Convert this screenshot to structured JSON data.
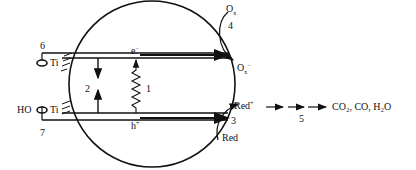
{
  "diagram": {
    "labels": {
      "n1": "1",
      "n2": "2",
      "n3": "3",
      "n4": "4",
      "n5": "5",
      "n6": "6",
      "n7": "7",
      "electron": "e",
      "electron_sup": "−",
      "hole": "h",
      "hole_sup": "+",
      "ti_top": "Ti",
      "ti_bottom": "Ti",
      "ho": "HO",
      "ox": "O",
      "ox_sub": "x",
      "ox_minus": "O",
      "ox_minus_sub": "x",
      "ox_minus_sup": "−",
      "red_plus": "Red",
      "red_plus_sup": "+",
      "red": "Red",
      "products": "CO₂, CO, H₂O"
    },
    "colors": {
      "stroke": "#111111",
      "background": "#ffffff"
    }
  }
}
